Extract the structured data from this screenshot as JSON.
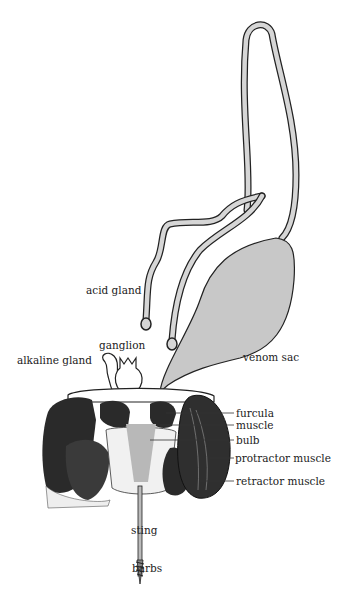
{
  "diagram": {
    "labels": {
      "acid_gland": "acid gland",
      "ganglion": "ganglion",
      "alkaline_gland": "alkaline gland",
      "venom_sac": "venom sac",
      "furcula": "furcula",
      "muscle": "muscle",
      "bulb": "bulb",
      "protractor_muscle": "protractor muscle",
      "retractor_muscle": "retractor muscle",
      "sting": "sting",
      "barbs": "barbs"
    },
    "colors": {
      "venom_fill": "#c8c8c8",
      "outline": "#222222",
      "muscle_dark": "#1a1a1a",
      "background": "#ffffff"
    }
  }
}
